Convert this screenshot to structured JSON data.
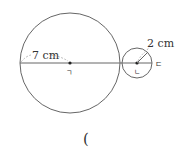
{
  "diagram": {
    "large_circle": {
      "center_label": "ㄱ",
      "radius_label": "7 cm",
      "cx": 70,
      "cy": 63,
      "r": 50
    },
    "small_circle": {
      "center_label": "ㄴ",
      "radius_label": "2 cm",
      "cx": 137,
      "cy": 63,
      "r": 15
    },
    "end_point_label": "ㄷ",
    "answer_bracket": "(",
    "colors": {
      "stroke": "#555555",
      "text": "#333333",
      "dashed": "#999999"
    }
  }
}
